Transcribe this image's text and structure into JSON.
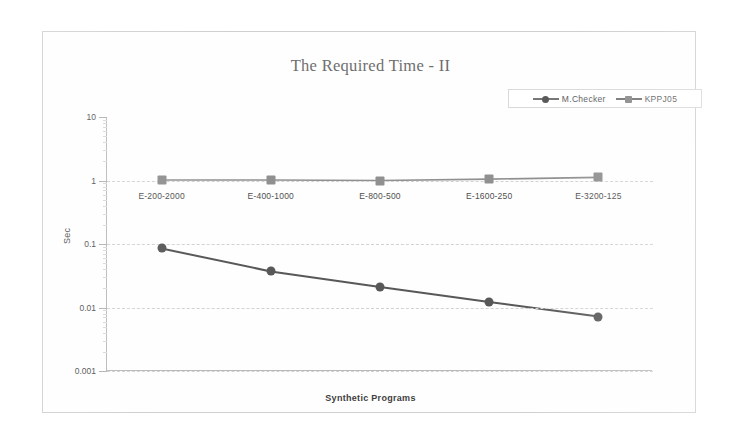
{
  "chart_data": {
    "type": "line",
    "title": "The Required Time - II",
    "xlabel": "Synthetic Programs",
    "ylabel": "Sec",
    "yscale": "log",
    "ylim": [
      0.001,
      10
    ],
    "ytick_labels": [
      "10",
      "1",
      "0.1",
      "0.01",
      "0.001"
    ],
    "ytick_values": [
      10,
      1,
      0.1,
      0.01,
      0.001
    ],
    "grid": true,
    "legend_position": "top-right",
    "categories": [
      "E-200-2000",
      "E-400-1000",
      "E-800-500",
      "E-1600-250",
      "E-3200-125"
    ],
    "series": [
      {
        "name": "M.Checker",
        "marker": "circle",
        "color": "#585858",
        "values": [
          0.085,
          0.037,
          0.021,
          0.0122,
          0.0072
        ]
      },
      {
        "name": "KPPJ05",
        "marker": "square",
        "color": "#909090",
        "values": [
          1.02,
          1.02,
          1.0,
          1.05,
          1.12
        ]
      }
    ]
  },
  "legend": {
    "entries": [
      {
        "label": "M.Checker",
        "marker": "circle"
      },
      {
        "label": "KPPJ05",
        "marker": "square"
      }
    ]
  },
  "colors": {
    "series_primary": "#585858",
    "series_secondary": "#909090",
    "axis": "#b9b9b9",
    "grid": "#d2d2d2",
    "title_text": "#6e6e6e"
  }
}
